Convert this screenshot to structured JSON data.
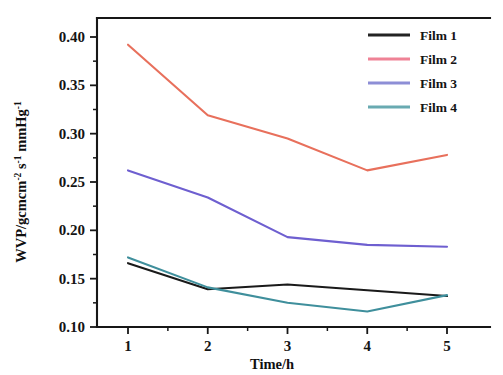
{
  "chart_data": {
    "type": "line",
    "title": "",
    "subtitle": "",
    "xlabel": "Time/h",
    "ylabel": "WVP/gcmcm-2 s-1 mmHg-1",
    "ylabel_parts": [
      {
        "text": "WVP/gcmcm",
        "sup": "-2"
      },
      {
        "text": " s",
        "sup": "-1"
      },
      {
        "text": " mmHg",
        "sup": "-1"
      }
    ],
    "x": [
      1,
      2,
      3,
      4,
      5
    ],
    "xticklabels": [
      "1",
      "2",
      "3",
      "4",
      "5"
    ],
    "yticklabels": [
      "0.10",
      "0.15",
      "0.20",
      "0.25",
      "0.30",
      "0.35",
      "0.40"
    ],
    "yticks": [
      0.1,
      0.15,
      0.2,
      0.25,
      0.3,
      0.35,
      0.4
    ],
    "yminorticks": [
      0.125,
      0.175,
      0.225,
      0.275,
      0.325,
      0.375
    ],
    "xminorticks": [
      1.5,
      2.5,
      3.5,
      4.5
    ],
    "xlim": [
      0.62,
      5.6
    ],
    "ylim": [
      0.1,
      0.415
    ],
    "grid": false,
    "legend_position": "top-right",
    "series": [
      {
        "name": "Film 1",
        "color": "#1a1a1a",
        "legend_color": "#232323",
        "values": [
          0.166,
          0.139,
          0.144,
          0.138,
          0.132
        ]
      },
      {
        "name": "Film 2",
        "color": "#e8705c",
        "legend_color": "#ef8296",
        "values": [
          0.392,
          0.319,
          0.295,
          0.262,
          0.278
        ]
      },
      {
        "name": "Film 3",
        "color": "#6e5fd0",
        "legend_color": "#8d8ed6",
        "values": [
          0.262,
          0.234,
          0.193,
          0.185,
          0.183
        ]
      },
      {
        "name": "Film 4",
        "color": "#3f8f9c",
        "legend_color": "#69aab1",
        "values": [
          0.172,
          0.141,
          0.125,
          0.116,
          0.133
        ]
      }
    ]
  },
  "legend": {
    "items": [
      {
        "label": "Film 1"
      },
      {
        "label": "Film 2"
      },
      {
        "label": "Film 3"
      },
      {
        "label": "Film 4"
      }
    ]
  },
  "axes": {
    "x_title": "Time/h",
    "y_title_main": "WVP/gcmcm",
    "y_sup_1": "-2",
    "y_mid_1": " s",
    "y_sup_2": "-1",
    "y_mid_2": " mmHg",
    "y_sup_3": "-1"
  }
}
